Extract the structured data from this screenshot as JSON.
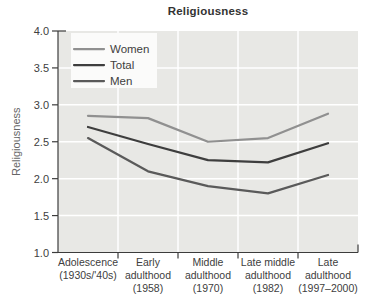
{
  "chart_data": {
    "type": "line",
    "title": "Religiousness",
    "ylabel": "Religiousness",
    "xlabel": "",
    "ylim": [
      1.0,
      4.0
    ],
    "yticks": [
      4.0,
      3.5,
      3.0,
      2.5,
      2.0,
      1.5,
      1.0
    ],
    "grid": true,
    "legend_position": "top-left",
    "categories": [
      {
        "label": "Adolescence (1930s/'40s)",
        "lines": [
          "Adolescence",
          "(1930s/'40s)"
        ]
      },
      {
        "label": "Early adulthood (1958)",
        "lines": [
          "Early",
          "adulthood",
          "(1958)"
        ]
      },
      {
        "label": "Middle adulthood (1970)",
        "lines": [
          "Middle",
          "adulthood",
          "(1970)"
        ]
      },
      {
        "label": "Late middle adulthood (1982)",
        "lines": [
          "Late middle",
          "adulthood",
          "(1982)"
        ]
      },
      {
        "label": "Late adulthood (1997–2000)",
        "lines": [
          "Late",
          "adulthood",
          "(1997–2000)"
        ]
      }
    ],
    "series": [
      {
        "name": "Women",
        "color": "#909090",
        "values": [
          2.85,
          2.82,
          2.5,
          2.55,
          2.88
        ]
      },
      {
        "name": "Total",
        "color": "#3e3e3e",
        "values": [
          2.7,
          2.47,
          2.25,
          2.22,
          2.48
        ]
      },
      {
        "name": "Men",
        "color": "#5a5a5a",
        "values": [
          2.55,
          2.1,
          1.9,
          1.8,
          2.05
        ]
      }
    ],
    "style": {
      "plot_bg": "#e8e8e5",
      "grid_color": "#ffffff",
      "axis_color": "#3c3c3c",
      "tick_text_color": "#404040",
      "ylabel_color": "#666666",
      "legend_bg": "#fbfbfa",
      "title_color": "#333333"
    }
  }
}
